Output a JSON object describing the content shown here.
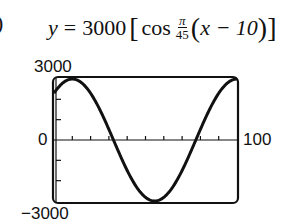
{
  "label_fragment": ")",
  "equation": {
    "lhs": "y",
    "equals": "=",
    "amplitude": "3000",
    "open_bracket": "[",
    "func": "cos",
    "frac_num": "π",
    "frac_den": "45",
    "open_paren": "(",
    "inner": "x − 10",
    "close_paren": ")",
    "close_bracket": "]"
  },
  "axis_labels": {
    "ymax": "3000",
    "zero": "0",
    "ymin": "−3000",
    "xmax": "100"
  },
  "chart_data": {
    "type": "line",
    "xlabel": "",
    "ylabel": "",
    "xlim": [
      0,
      100
    ],
    "ylim": [
      -3000,
      3000
    ],
    "x_tick_step": 10,
    "y_tick_step": 1000,
    "grid": false,
    "legend": null,
    "series": [
      {
        "name": "y = 3000 cos(π/45 (x − 10))",
        "x": [
          0,
          5,
          10,
          15,
          20,
          25,
          30,
          35,
          40,
          45,
          50,
          55,
          60,
          65,
          70,
          75,
          80,
          85,
          90,
          95,
          100
        ],
        "values": [
          2298,
          2954,
          3000,
          2954,
          2298,
          1500,
          521,
          -521,
          -1500,
          -2298,
          -2819,
          -3000,
          -2819,
          -2298,
          -1500,
          -521,
          521,
          1500,
          2298,
          2819,
          3000
        ]
      }
    ]
  }
}
